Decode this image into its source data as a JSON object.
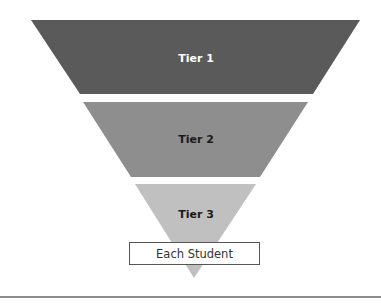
{
  "diagram": {
    "type": "inverted-pyramid",
    "tiers": [
      {
        "label": "Tier 1",
        "color": "#5a5a5a",
        "text_color": "#ffffff"
      },
      {
        "label": "Tier 2",
        "color": "#8e8e8e",
        "text_color": "#1a1a1a"
      },
      {
        "label": "Tier 3",
        "color": "#c0c0c0",
        "text_color": "#1a1a1a"
      }
    ],
    "base_box": {
      "label": "Each Student"
    }
  }
}
